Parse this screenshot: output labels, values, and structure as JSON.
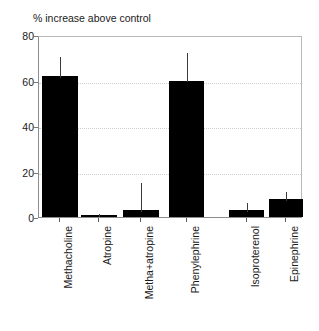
{
  "chart_data": {
    "type": "bar",
    "title": "% increase above control",
    "xlabel": "",
    "ylabel": "",
    "ylim": [
      0,
      80
    ],
    "yticks": [
      0,
      20,
      40,
      60,
      80
    ],
    "grid": "horizontal-dotted",
    "legend": "none",
    "categories": [
      "Methacholine",
      "Atropine",
      "Metha+atropine",
      "Phenylephrine",
      "Isoproterenol",
      "Epinephrine"
    ],
    "values": [
      62,
      1,
      3,
      60,
      3,
      8
    ],
    "error_upper": [
      71,
      2,
      16,
      73,
      7,
      12
    ],
    "bar_color": "#000000",
    "error_bar_color": "#3a3a3a",
    "background_color": "#ffffff",
    "axis_color": "#8c8c8c",
    "gridline_color": "#cfcfcf"
  },
  "axis": {
    "ytick_labels": [
      "0",
      "20",
      "40",
      "60",
      "80"
    ]
  }
}
